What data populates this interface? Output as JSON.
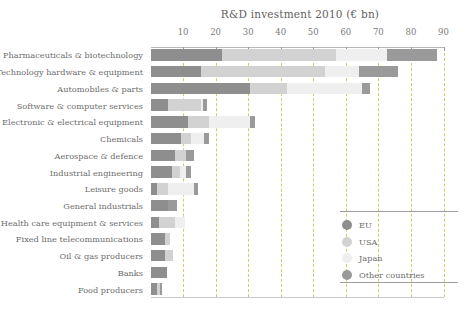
{
  "chart_data": {
    "type": "bar",
    "title": "R&D investment 2010 (€ bn)",
    "xlabel": "",
    "ylabel": "",
    "orientation": "horizontal",
    "stacked": true,
    "xlim": [
      0,
      90
    ],
    "xticks": [
      10,
      20,
      30,
      40,
      50,
      60,
      70,
      80,
      90
    ],
    "xtick_labels": [
      "10",
      "20",
      "30",
      "40",
      "50",
      "60",
      "70",
      "80",
      "90"
    ],
    "grid": "vertical-dashed",
    "legend_position": "bottom-right",
    "categories": [
      "Pharmaceuticals & biotechnology",
      "Technology hardware & equipment",
      "Automobiles & parts",
      "Software & computer services",
      "Electronic & electrical equipment",
      "Chemicals",
      "Aerospace & defence",
      "Industrial engineering",
      "Leisure goods",
      "General industrials",
      "Health care equipment & services",
      "Fixed line telecommunications",
      "Oil & gas producers",
      "Banks",
      "Food producers"
    ],
    "series": [
      {
        "name": "EU",
        "color": "#8e8e8e",
        "values": [
          22.0,
          15.5,
          30.5,
          5.5,
          11.5,
          9.5,
          7.5,
          6.5,
          2.0,
          5.5,
          2.5,
          4.5,
          4.5,
          5.0,
          2.0
        ]
      },
      {
        "name": "USA",
        "color": "#d2d2d2",
        "values": [
          35.0,
          38.0,
          11.5,
          10.0,
          6.5,
          3.0,
          3.5,
          2.5,
          3.5,
          0.0,
          5.0,
          1.5,
          2.5,
          0.0,
          1.0
        ]
      },
      {
        "name": "Japan",
        "color": "#efefef",
        "values": [
          15.5,
          10.5,
          23.0,
          0.5,
          12.5,
          4.0,
          0.0,
          2.0,
          8.0,
          0.0,
          3.0,
          0.0,
          0.0,
          0.0,
          0.0
        ]
      },
      {
        "name": "Other countries",
        "color": "#9a9a9a",
        "values": [
          15.5,
          12.0,
          2.5,
          1.5,
          1.5,
          1.5,
          2.5,
          1.5,
          1.0,
          2.5,
          0.0,
          0.0,
          0.0,
          0.0,
          0.5
        ]
      }
    ],
    "legend_entries": [
      {
        "label": "EU",
        "color": "#8e8e8e"
      },
      {
        "label": "USA",
        "color": "#d2d2d2"
      },
      {
        "label": "Japan",
        "color": "#efefef"
      },
      {
        "label": "Other countries",
        "color": "#9a9a9a"
      }
    ],
    "colors": {
      "grid": "#c9c44f",
      "axis": "#b7b7b7",
      "text": "#6d6d6d",
      "background": "#ffffff"
    }
  }
}
